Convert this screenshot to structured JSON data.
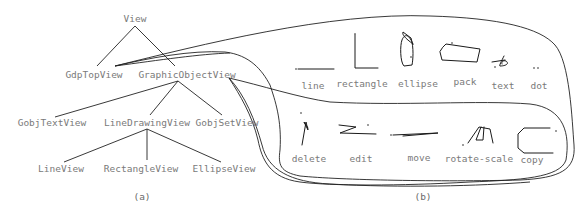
{
  "figure": {
    "panel_a": {
      "caption": "(a)",
      "nodes": {
        "view": "View",
        "gdp_top_view": "GdpTopView",
        "graphic_object_view": "GraphicObjectView",
        "gobj_text_view": "GobjTextView",
        "line_drawing_view": "LineDrawingView",
        "gobj_set_view": "GobjSetView",
        "line_view": "LineView",
        "rectangle_view": "RectangleView",
        "ellipse_view": "EllipseView"
      },
      "edges": [
        [
          "View",
          "GdpTopView"
        ],
        [
          "View",
          "GraphicObjectView"
        ],
        [
          "GraphicObjectView",
          "GobjTextView"
        ],
        [
          "GraphicObjectView",
          "LineDrawingView"
        ],
        [
          "GraphicObjectView",
          "GobjSetView"
        ],
        [
          "LineDrawingView",
          "LineView"
        ],
        [
          "LineDrawingView",
          "RectangleView"
        ],
        [
          "LineDrawingView",
          "EllipseView"
        ]
      ]
    },
    "panel_b": {
      "caption": "(b)",
      "top_gesture_set": {
        "owner": "GdpTopView",
        "gestures": [
          "line",
          "rectangle",
          "ellipse",
          "pack",
          "text",
          "dot"
        ]
      },
      "bottom_gesture_set": {
        "owner": "GraphicObjectView",
        "gestures": [
          "delete",
          "edit",
          "move",
          "rotate-scale",
          "copy"
        ]
      }
    }
  }
}
